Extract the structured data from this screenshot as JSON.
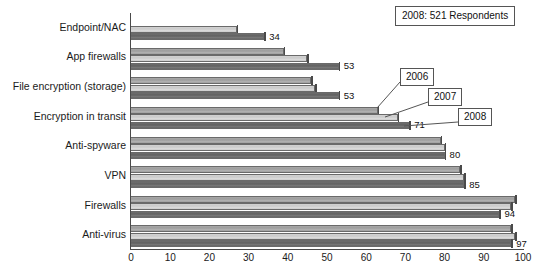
{
  "chart_data": {
    "type": "bar",
    "orientation": "horizontal",
    "title": "2008: 521 Respondents",
    "xlabel": "",
    "ylabel": "",
    "xlim": [
      0,
      100
    ],
    "xticks": [
      0,
      10,
      20,
      30,
      40,
      50,
      60,
      70,
      80,
      90,
      100
    ],
    "grid": false,
    "legend_position": "callout-annotations",
    "categories": [
      "Endpoint/NAC",
      "App firewalls",
      "File encryption (storage)",
      "Encryption in transit",
      "Anti-spyware",
      "VPN",
      "Firewalls",
      "Anti-virus"
    ],
    "series": [
      {
        "name": "2006",
        "color": "#a0a0a0",
        "values": [
          null,
          39,
          46,
          63,
          79,
          84,
          98,
          97
        ]
      },
      {
        "name": "2007",
        "color": "#cccccc",
        "values": [
          27,
          45,
          47,
          68,
          80,
          85,
          97,
          98
        ]
      },
      {
        "name": "2008",
        "color": "#666666",
        "values": [
          34,
          53,
          53,
          71,
          80,
          85,
          94,
          97
        ]
      }
    ],
    "data_labels": {
      "series": "2008",
      "values": [
        "34",
        "53",
        "53",
        "71",
        "80",
        "85",
        "94",
        "97"
      ]
    },
    "annotations": [
      {
        "text": "2006",
        "points_to": "Encryption in transit 2006 bar end"
      },
      {
        "text": "2007",
        "points_to": "Encryption in transit 2007 bar end"
      },
      {
        "text": "2008",
        "points_to": "Encryption in transit 2008 bar end"
      }
    ]
  }
}
